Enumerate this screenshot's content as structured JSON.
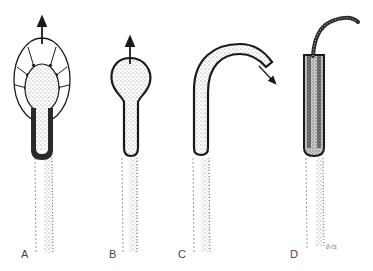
{
  "diagram": {
    "panels": [
      {
        "id": "A",
        "label": "A",
        "description": "bulb-tipped tube with radial expansion arrows and upward arrow"
      },
      {
        "id": "B",
        "label": "B",
        "description": "bulb-tipped tube with single upward arrow"
      },
      {
        "id": "C",
        "label": "C",
        "description": "curved hooked tube with tip arrow pointing down-right"
      },
      {
        "id": "D",
        "label": "D",
        "description": "straight sleeve with thin curved filament emerging from top"
      }
    ],
    "colors": {
      "outline": "#1a1a1a",
      "stipple": "#8a8a8a",
      "background": "#ffffff"
    }
  }
}
